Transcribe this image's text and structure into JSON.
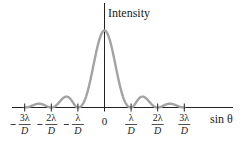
{
  "chart_data": {
    "type": "line",
    "title": "",
    "xlabel": "sin θ",
    "ylabel": "Intensity",
    "grid": false,
    "legend": null,
    "x_ticks": [
      {
        "value": -3,
        "sign": "−",
        "numerator": "3λ",
        "denominator": "D"
      },
      {
        "value": -2,
        "sign": "−",
        "numerator": "2λ",
        "denominator": "D"
      },
      {
        "value": -1,
        "sign": "−",
        "numerator": "λ",
        "denominator": "D"
      },
      {
        "value": 0,
        "label": "0"
      },
      {
        "value": 1,
        "sign": "",
        "numerator": "λ",
        "denominator": "D"
      },
      {
        "value": 2,
        "sign": "",
        "numerator": "2λ",
        "denominator": "D"
      },
      {
        "value": 3,
        "sign": "",
        "numerator": "3λ",
        "denominator": "D"
      }
    ],
    "x_unit": "λ/D",
    "xlim": [
      -3.5,
      4.8
    ],
    "ylim": [
      0,
      1
    ],
    "series": [
      {
        "name": "Single-slit diffraction intensity (sinc²)",
        "function": "sinc^2",
        "x_range": [
          -3,
          3
        ],
        "peak_value": 1.0,
        "minima_at": [
          -3,
          -2,
          -1,
          1,
          2,
          3
        ],
        "secondary_maxima": [
          {
            "x": -2.46,
            "relative_height": 0.09
          },
          {
            "x": -1.43,
            "relative_height": 0.15
          },
          {
            "x": 1.43,
            "relative_height": 0.15
          },
          {
            "x": 2.46,
            "relative_height": 0.09
          }
        ],
        "color": "#a3a3a3"
      }
    ],
    "colors": {
      "curve": "#a3a3a3",
      "axes": "#222222",
      "text": "#222222"
    }
  }
}
